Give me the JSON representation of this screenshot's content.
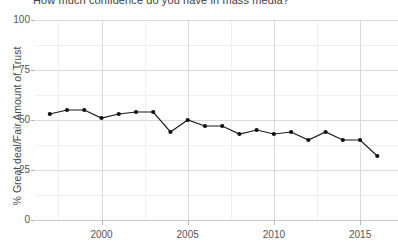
{
  "chart_data": {
    "type": "line",
    "title": "How much confidence do you have in mass media?",
    "subtitle": "",
    "xlabel": "",
    "ylabel": "% Great deal/Fair Amount of Trust",
    "ylim": [
      0,
      100
    ],
    "xlim": [
      1996.2,
      2017.2
    ],
    "yticks": [
      0,
      25,
      50,
      75,
      100
    ],
    "ytick_labels": [
      "0",
      "25",
      "50",
      "75",
      "100"
    ],
    "y_minor_ticks": [
      12.5,
      37.5,
      62.5,
      87.5
    ],
    "xticks": [
      2000,
      2005,
      2010,
      2015
    ],
    "xtick_labels": [
      "2000",
      "2005",
      "2010",
      "2015"
    ],
    "x_minor_ticks": [
      1997.5,
      2002.5,
      2007.5,
      2012.5,
      2017.5
    ],
    "grid": true,
    "legend": false,
    "legend_position": "right",
    "marker": "circle",
    "line_color": "#1a1a1a",
    "marker_color": "#111111",
    "x": [
      1997,
      1998,
      1999,
      2000,
      2001,
      2002,
      2003,
      2004,
      2005,
      2006,
      2007,
      2008,
      2009,
      2010,
      2011,
      2012,
      2013,
      2014,
      2015,
      2016
    ],
    "values": [
      53,
      55,
      55,
      51,
      53,
      54,
      54,
      44,
      50,
      47,
      47,
      43,
      45,
      43,
      44,
      40,
      44,
      40,
      40,
      32
    ],
    "series": [
      {
        "name": "% Great deal/Fair Amount of Trust",
        "x": [
          1997,
          1998,
          1999,
          2000,
          2001,
          2002,
          2003,
          2004,
          2005,
          2006,
          2007,
          2008,
          2009,
          2010,
          2011,
          2012,
          2013,
          2014,
          2015,
          2016
        ],
        "values": [
          53,
          55,
          55,
          51,
          53,
          54,
          54,
          44,
          50,
          47,
          47,
          43,
          45,
          43,
          44,
          40,
          44,
          40,
          40,
          32
        ]
      }
    ],
    "annotations": []
  },
  "axes": {
    "y_title": "% Great deal/Fair Amount of Trust",
    "x_title": ""
  },
  "legend_ghost": {
    "line1": "",
    "line2": ""
  }
}
